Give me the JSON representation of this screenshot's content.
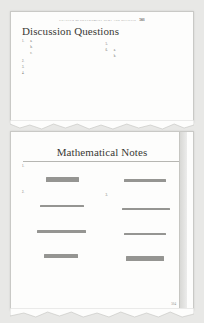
{
  "background_color": "#e8e8e6",
  "paper_color": "#fdfdfc",
  "ink_color": "#5a5a56",
  "page_one": {
    "running_header": {
      "chapter_text": "CHAPTER 25  GOVERNMENT DEBT AND DEFICITS",
      "folio": "503"
    },
    "heading": "Discussion Questions",
    "left_column": [
      {
        "number": "1.",
        "lines": 4,
        "sub_items": [
          {
            "label": "a.",
            "lines": 1
          },
          {
            "label": "b.",
            "lines": 1
          },
          {
            "label": "c.",
            "lines": 2
          }
        ]
      },
      {
        "number": "2.",
        "lines": 5
      },
      {
        "number": "3.",
        "lines": 5
      },
      {
        "number": "4.",
        "lines": 5
      }
    ],
    "right_column": [
      {
        "number": "",
        "lines": 2
      },
      {
        "number": "5.",
        "lines": 5
      },
      {
        "number": "6.",
        "lines": 4,
        "sub_items": [
          {
            "label": "a.",
            "lines": 3
          },
          {
            "label": "b.",
            "lines": 4
          }
        ]
      }
    ]
  },
  "page_two": {
    "heading": "Mathematical Notes",
    "left_column": [
      {
        "number": "1.",
        "lines": 3,
        "equation": "tall",
        "after_lines": 2
      },
      {
        "number": "2.",
        "lines": 4,
        "equation": "short",
        "after_lines": 0
      },
      {
        "number": "",
        "lines": 4,
        "equation": "short",
        "after_lines": 1
      },
      {
        "number": "",
        "lines": 1,
        "equation": "tall",
        "after_lines": 0
      },
      {
        "number": "",
        "lines": 9,
        "equation": "none",
        "after_lines": 0
      }
    ],
    "right_column": [
      {
        "number": "",
        "lines": 0,
        "equation": "short",
        "after_lines": 9
      },
      {
        "number": "",
        "lines": 9,
        "equation": "none",
        "after_lines": 0
      },
      {
        "number": "3.",
        "lines": 4,
        "equation": "short",
        "after_lines": 3
      },
      {
        "number": "",
        "lines": 1,
        "equation": "short",
        "after_lines": 1
      },
      {
        "number": "",
        "lines": 1,
        "equation": "tall",
        "after_lines": 0
      }
    ],
    "folio": "504"
  }
}
